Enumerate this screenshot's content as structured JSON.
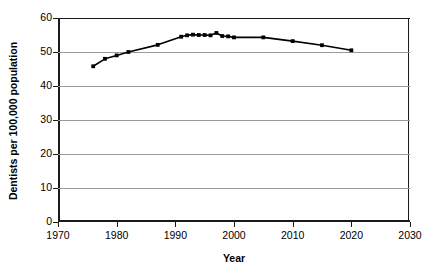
{
  "chart_data": {
    "type": "line",
    "title": "",
    "xlabel": "Year",
    "ylabel": "Dentists per 100,000 population",
    "xlim": [
      1970,
      2030
    ],
    "ylim": [
      0,
      60
    ],
    "xticks": [
      1970,
      1980,
      1990,
      2000,
      2010,
      2020,
      2030
    ],
    "yticks": [
      0,
      10,
      20,
      30,
      40,
      50,
      60
    ],
    "grid": "horizontal",
    "legend": "none",
    "marker": "square",
    "line_color": "#000000",
    "marker_color": "#000000",
    "grid_color": "#9a9a9a",
    "axis_color": "#1a1a1a",
    "series": [
      {
        "name": "Dentists per 100,000 population",
        "x": [
          1976,
          1978,
          1980,
          1982,
          1987,
          1991,
          1992,
          1993,
          1994,
          1995,
          1996,
          1997,
          1998,
          1999,
          2000,
          2005,
          2010,
          2015,
          2020
        ],
        "values": [
          45.8,
          48.0,
          49.0,
          50.0,
          52.1,
          54.5,
          54.9,
          55.1,
          55.0,
          55.0,
          54.9,
          55.6,
          54.7,
          54.6,
          54.3,
          54.3,
          53.2,
          52.0,
          50.5
        ]
      }
    ]
  },
  "axes": {
    "y_tick_labels": [
      "60",
      "50",
      "40",
      "30",
      "20",
      "10",
      "0"
    ],
    "x_tick_labels": [
      "1970",
      "1980",
      "1990",
      "2000",
      "2010",
      "2020",
      "2030"
    ],
    "y_title": "Dentists per 100,000 population",
    "x_title": "Year"
  }
}
